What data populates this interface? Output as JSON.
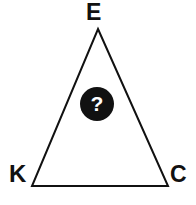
{
  "figure": {
    "type": "labelled-triangle-puzzle",
    "background_color": "#ffffff",
    "stroke_color": "#111111",
    "stroke_width": 2,
    "vertices": {
      "apex": {
        "label": "E",
        "x": 98,
        "y": 29
      },
      "bottom_left": {
        "label": "K",
        "x": 32,
        "y": 186
      },
      "bottom_right": {
        "label": "C",
        "x": 168,
        "y": 186
      }
    },
    "center_marker": {
      "glyph": "?",
      "shape": "circle",
      "fill_color": "#111111",
      "glyph_color": "#ffffff",
      "center_x": 97,
      "center_y": 104,
      "diameter": 34
    }
  }
}
